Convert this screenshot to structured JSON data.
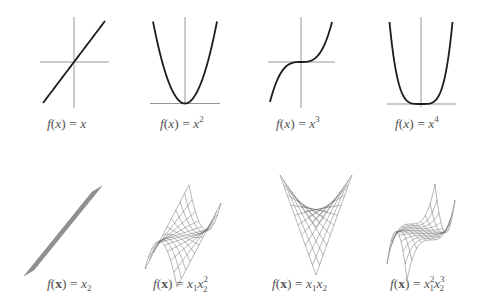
{
  "chart_data": [
    {
      "type": "line",
      "title": "f(x) = x",
      "function": "x",
      "xlim": [
        -1,
        1
      ],
      "ylim": [
        -1,
        1
      ],
      "axes": "centered",
      "curve": {
        "x": [
          -1,
          1
        ],
        "y": [
          -1,
          1
        ]
      },
      "label": {
        "prefix": "f(x) = x",
        "sup": ""
      }
    },
    {
      "type": "line",
      "title": "f(x) = x^2",
      "function": "x^2",
      "xlim": [
        -1,
        1
      ],
      "ylim": [
        0,
        1
      ],
      "axes": "bottom",
      "label": {
        "prefix": "f(x) = x",
        "sup": "2"
      }
    },
    {
      "type": "line",
      "title": "f(x) = x^3",
      "function": "x^3",
      "xlim": [
        -1,
        1
      ],
      "ylim": [
        -1,
        1
      ],
      "axes": "centered",
      "label": {
        "prefix": "f(x) = x",
        "sup": "3"
      }
    },
    {
      "type": "line",
      "title": "f(x) = x^4",
      "function": "x^4",
      "xlim": [
        -1,
        1
      ],
      "ylim": [
        0,
        1
      ],
      "axes": "bottom",
      "label": {
        "prefix": "f(x) = x",
        "sup": "4"
      }
    },
    {
      "type": "surface",
      "title": "f(x) = x2",
      "function": "x2",
      "grid": "wireframe",
      "label": {
        "text": "f(x) = x_2"
      }
    },
    {
      "type": "surface",
      "title": "f(x) = x1 x2^2",
      "function": "x1*x2^2",
      "grid": "wireframe",
      "label": {
        "text": "f(x) = x_1 x_2^2"
      }
    },
    {
      "type": "surface",
      "title": "f(x) = x1 x2",
      "function": "x1*x2",
      "grid": "wireframe",
      "label": {
        "text": "f(x) = x_1 x_2"
      }
    },
    {
      "type": "surface",
      "title": "f(x) = x1^2 x2^3",
      "function": "x1^2*x2^3",
      "grid": "wireframe",
      "label": {
        "text": "f(x) = x_1^2 x_2^3"
      }
    }
  ],
  "labels": {
    "f": "f",
    "open": "(",
    "close": ")",
    "x": "x",
    "xbold": "x",
    "eq": " = ",
    "sub1": "1",
    "sub2": "2",
    "sup2": "2",
    "sup3": "3",
    "sup4": "4"
  },
  "colors": {
    "curve": "#1c1c1c",
    "axis": "#8a8a8a",
    "mesh": "#6e6e6e",
    "label": "#555555"
  }
}
